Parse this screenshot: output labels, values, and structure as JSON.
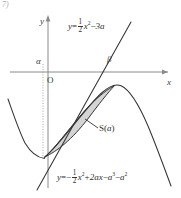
{
  "figure": {
    "kind": "coordinate-plane-diagram",
    "corner_mark": "7)",
    "axes": {
      "x_label": "x",
      "y_label": "y",
      "origin_label": "O",
      "x_axis_y_px": 72,
      "y_axis_x_px": 48
    },
    "tick_labels": {
      "alpha": "α",
      "beta": "β"
    },
    "region_label": {
      "text_prefix": "S(",
      "text_var": "a",
      "text_suffix": ")",
      "full": "S(a)"
    },
    "equations": {
      "line": {
        "lhs": "y",
        "eq": "=",
        "coef_num": "1",
        "coef_den": "2",
        "term_x": "x",
        "term_x_exp": "2",
        "minus": "−",
        "tail": "3a",
        "full": "y = 1/2 x² − 3a"
      },
      "parabola": {
        "lhs": "y",
        "eq": "=",
        "leading_sign": "−",
        "coef_num": "1",
        "coef_den": "2",
        "term_x": "x",
        "term_x_exp": "2",
        "plus": "+",
        "term_2ax": "2ax",
        "minus1": "−",
        "term_a3": "a",
        "term_a3_exp": "3",
        "minus2": "−",
        "term_a2": "a",
        "term_a2_exp": "2",
        "full": "y = − 1/2 x² + 2ax − a³ − a²"
      }
    },
    "colors": {
      "curve": "#333333",
      "axis": "#8a8a8a",
      "shade_fill": "#d4d4d4",
      "shade_stroke": "#333333",
      "dotted_guide": "#9a9a9a",
      "text": "#2b2b2b",
      "background": "#ffffff"
    }
  }
}
